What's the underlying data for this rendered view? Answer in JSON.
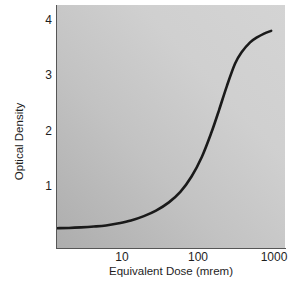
{
  "chart_data": {
    "type": "line",
    "title": "",
    "xlabel": "Equivalent Dose (mrem)",
    "ylabel": "Optical Density",
    "xscale": "log",
    "yscale": "linear",
    "xlim": [
      1.8,
      1000
    ],
    "ylim": [
      0,
      4.42
    ],
    "grid": false,
    "legend": null,
    "xticks": [
      {
        "value": 10,
        "label": "10"
      },
      {
        "value": 100,
        "label": "100"
      },
      {
        "value": 1000,
        "label": "1000"
      }
    ],
    "yticks": [
      {
        "value": 1,
        "label": "1"
      },
      {
        "value": 2,
        "label": "2"
      },
      {
        "value": 3,
        "label": "3"
      },
      {
        "value": 4,
        "label": "4"
      }
    ],
    "series": [
      {
        "name": "Characteristic curve",
        "color": "#1a1a1a",
        "linewidth": 2.6,
        "x": [
          1.8,
          2.5,
          3.5,
          5,
          7,
          10,
          14,
          20,
          28,
          40,
          55,
          75,
          100,
          130,
          160,
          200,
          250,
          300,
          380,
          460,
          560,
          680
        ],
        "y": [
          0.36,
          0.365,
          0.375,
          0.39,
          0.41,
          0.45,
          0.5,
          0.58,
          0.68,
          0.83,
          1.02,
          1.3,
          1.66,
          2.1,
          2.5,
          2.95,
          3.35,
          3.56,
          3.74,
          3.83,
          3.9,
          3.95
        ]
      }
    ]
  },
  "axes": {
    "x_title": "Equivalent Dose (mrem)",
    "y_title": "Optical Density",
    "x_tick_labels": [
      "10",
      "100",
      "1000"
    ],
    "y_tick_labels": [
      "4",
      "3",
      "2",
      "1"
    ]
  },
  "style": {
    "panel_fill": "#d3d3d3",
    "curve_color": "#1a1a1a",
    "axis_color": "#565656",
    "text_color": "#1e1e1e"
  }
}
